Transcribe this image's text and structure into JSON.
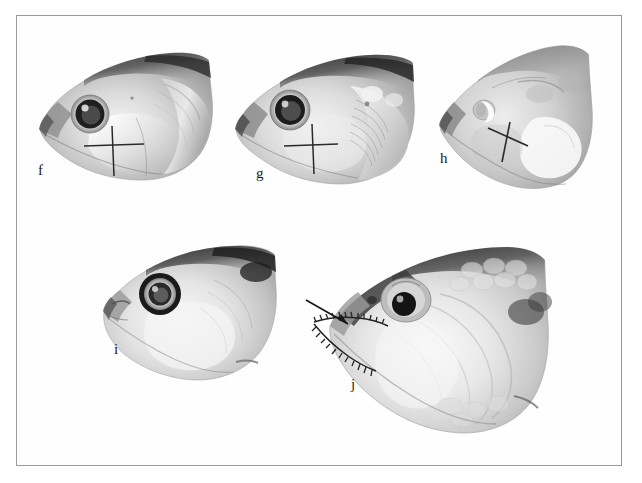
{
  "figure": {
    "background_color": "#ffffff",
    "border_color": "#9a9a9a",
    "plate_type": "photographic-plate",
    "image_mode": "grayscale",
    "panel_count": 5
  },
  "panels": [
    {
      "id": "f",
      "label": "f",
      "subject": "fish-head-lateral-view",
      "orientation": "facing-left",
      "eye": "large-dark-pupil-with-pale-ring",
      "annotation": "upright-cross-mark",
      "annotation_color": "#2a2a2a",
      "label_x": 38,
      "label_y": 163
    },
    {
      "id": "g",
      "label": "g",
      "subject": "fish-head-lateral-view",
      "orientation": "facing-left",
      "eye": "large-dark-pupil-with-pale-ring",
      "annotation": "upright-cross-mark",
      "annotation_color": "#2a2a2a",
      "label_x": 256,
      "label_y": 166
    },
    {
      "id": "h",
      "label": "h",
      "subject": "fish-head-lateral-view",
      "orientation": "facing-left",
      "eye": "small-pale-crescent-eye",
      "annotation": "diagonal-cross-mark",
      "annotation_color": "#2a2a2a",
      "label_x": 441,
      "label_y": 161
    },
    {
      "id": "i",
      "label": "i",
      "subject": "fish-head-lateral-view",
      "orientation": "facing-left",
      "eye": "large-dark-pupil-with-bold-ring",
      "annotation": "none",
      "annotation_color": "#2a2a2a",
      "label_x": 114,
      "label_y": 352
    },
    {
      "id": "j",
      "label": "j",
      "subject": "fish-head-lateral-view",
      "orientation": "facing-left",
      "eye": "round-black-pupil",
      "annotation": "arrow-pointing-to-serrated-jaw-margin",
      "annotation_color": "#1a1a1a",
      "label_x": 351,
      "label_y": 385
    }
  ]
}
